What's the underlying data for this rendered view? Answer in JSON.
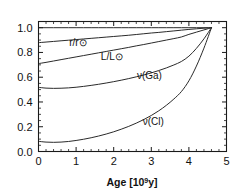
{
  "chart_data": {
    "type": "line",
    "title": "",
    "xlabel": "Age [10⁹y]",
    "xlabel_base": "Age  [10",
    "xlabel_exp": "9",
    "xlabel_tail": "y]",
    "ylabel": "",
    "xlim": [
      0,
      5
    ],
    "ylim": [
      0,
      1.05
    ],
    "grid": false,
    "legend": "inline-labels",
    "x_ticks": [
      "0",
      "1",
      "2",
      "3",
      "4",
      "5"
    ],
    "x_tick_values": [
      0,
      1,
      2,
      3,
      4,
      5
    ],
    "x_minor_step": 0.2,
    "y_ticks": [
      "0.0",
      "0.2",
      "0.4",
      "0.6",
      "0.8",
      "1.0"
    ],
    "y_tick_values": [
      0.0,
      0.2,
      0.4,
      0.6,
      0.8,
      1.0
    ],
    "y_minor_step": 0.05,
    "present_age": 4.6,
    "x": [
      0.0,
      0.2,
      0.4,
      0.6,
      0.8,
      1.0,
      1.2,
      1.4,
      1.6,
      1.8,
      2.0,
      2.2,
      2.4,
      2.6,
      2.8,
      3.0,
      3.2,
      3.4,
      3.6,
      3.8,
      4.0,
      4.2,
      4.4,
      4.6
    ],
    "series": [
      {
        "name": "unity-reference",
        "label": "",
        "label_x": null,
        "label_y": null,
        "values": [
          1.0,
          1.0,
          1.0,
          1.0,
          1.0,
          1.0,
          1.0,
          1.0,
          1.0,
          1.0,
          1.0,
          1.0,
          1.0,
          1.0,
          1.0,
          1.0,
          1.0,
          1.0,
          1.0,
          1.0,
          1.0,
          1.0,
          1.0,
          1.0
        ]
      },
      {
        "name": "radius",
        "label": "r/r⊙",
        "label_num": "r",
        "label_den": "r",
        "label_x": 1.05,
        "label_y": 0.855,
        "values": [
          0.879,
          0.884,
          0.889,
          0.894,
          0.899,
          0.904,
          0.909,
          0.914,
          0.919,
          0.924,
          0.929,
          0.934,
          0.939,
          0.945,
          0.951,
          0.957,
          0.962,
          0.968,
          0.974,
          0.98,
          0.986,
          0.991,
          0.996,
          1.0
        ]
      },
      {
        "name": "luminosity",
        "label": "L/L⊙",
        "label_num": "L",
        "label_den": "L",
        "label_x": 1.95,
        "label_y": 0.742,
        "values": [
          0.71,
          0.72,
          0.731,
          0.742,
          0.753,
          0.764,
          0.775,
          0.786,
          0.797,
          0.808,
          0.819,
          0.83,
          0.841,
          0.853,
          0.864,
          0.876,
          0.888,
          0.9,
          0.912,
          0.925,
          0.946,
          0.964,
          0.982,
          1.0
        ]
      },
      {
        "name": "neutrino-gallium",
        "label": "ν(Ga)",
        "label_x": 2.95,
        "label_y": 0.585,
        "values": [
          0.518,
          0.512,
          0.51,
          0.511,
          0.514,
          0.519,
          0.526,
          0.534,
          0.543,
          0.553,
          0.564,
          0.576,
          0.589,
          0.603,
          0.618,
          0.635,
          0.654,
          0.675,
          0.699,
          0.727,
          0.77,
          0.833,
          0.91,
          1.0
        ]
      },
      {
        "name": "neutrino-chlorine",
        "label": "ν(Cl)",
        "label_x": 3.05,
        "label_y": 0.215,
        "values": [
          0.082,
          0.076,
          0.074,
          0.076,
          0.081,
          0.089,
          0.099,
          0.111,
          0.125,
          0.141,
          0.159,
          0.18,
          0.203,
          0.229,
          0.258,
          0.291,
          0.329,
          0.373,
          0.424,
          0.484,
          0.571,
          0.69,
          0.835,
          1.0
        ]
      }
    ]
  }
}
